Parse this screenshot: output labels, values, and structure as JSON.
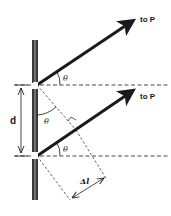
{
  "figure": {
    "type": "double-slit path difference diagram",
    "labels": {
      "top_ray_target": "to P",
      "bottom_ray_target": "to P",
      "slit_separation": "d",
      "angle_symbol": "θ",
      "path_difference": "Δl"
    },
    "elements": {
      "barrier": "vertical wall with two slits",
      "rays": 2,
      "reference_lines": "horizontal dashed lines through each slit",
      "construction": "dashed perpendicular from upper slit to lower ray forming right angle",
      "angles_marked": 3
    },
    "colors": {
      "ink": "#1a1a1a",
      "wall": "#3a3a3a",
      "wall_center": "#8a8a8a",
      "background": "#ffffff"
    }
  }
}
